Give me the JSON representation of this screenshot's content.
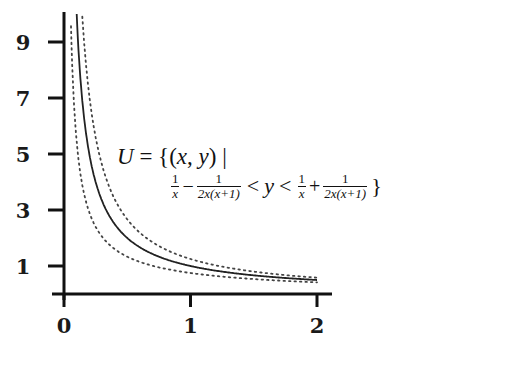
{
  "chart_data": {
    "type": "line",
    "title": "",
    "xlabel": "",
    "ylabel": "",
    "xlim": [
      0,
      2
    ],
    "ylim": [
      0,
      10
    ],
    "grid": false,
    "legend": null,
    "x_ticks": [
      0,
      1,
      2
    ],
    "x_tick_labels": [
      "0",
      "1",
      "2"
    ],
    "y_ticks": [
      1,
      3,
      5,
      7,
      9
    ],
    "y_tick_labels": [
      "1",
      "3",
      "5",
      "7",
      "9"
    ],
    "series": [
      {
        "name": "y = 1/x",
        "style": "solid",
        "expr": "1/x",
        "x": [
          0.1,
          0.2,
          0.25,
          0.5,
          1.0,
          1.5,
          2.0
        ],
        "values": [
          10,
          5,
          4,
          2,
          1,
          0.667,
          0.5
        ]
      },
      {
        "name": "upper bound 1/x + 1/(2x(x+1))",
        "style": "dotted",
        "expr": "1/x + 1/(2x(x+1))",
        "x": [
          0.1,
          0.2,
          0.25,
          0.5,
          1.0,
          1.5,
          2.0
        ],
        "values": [
          14.55,
          7.08,
          5.6,
          2.67,
          1.25,
          0.8,
          0.583
        ]
      },
      {
        "name": "lower bound 1/x - 1/(2x(x+1))",
        "style": "dotted",
        "expr": "1/x - 1/(2x(x+1))",
        "x": [
          0.1,
          0.2,
          0.25,
          0.5,
          1.0,
          1.5,
          2.0
        ],
        "values": [
          5.45,
          2.92,
          2.4,
          1.33,
          0.75,
          0.533,
          0.417
        ]
      }
    ],
    "annotations": [
      "U = {(x, y) |",
      "1/x − 1/(2x(x+1)) < y < 1/x + 1/(2x(x+1)) }"
    ]
  },
  "labels": {
    "line1": {
      "U": "U",
      "eq": " = {(",
      "x": "x",
      "comma": ", ",
      "y": "y",
      "close": ") |"
    },
    "line2": {
      "frac_a_num": "1",
      "frac_a_den": "x",
      "minus": "−",
      "frac_b_num": "1",
      "frac_b_den": "2x(x+1)",
      "lt1": "<",
      "y": "y",
      "lt2": "<",
      "frac_c_num": "1",
      "frac_c_den": "x",
      "plus": "+",
      "frac_d_num": "1",
      "frac_d_den": "2x(x+1)",
      "brace": "}"
    }
  }
}
